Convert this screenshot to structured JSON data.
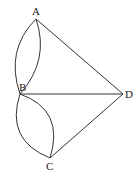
{
  "diagram": {
    "type": "geometry",
    "points": {
      "A": {
        "label": "A",
        "x": 36,
        "y": 19
      },
      "B": {
        "label": "B",
        "x": 20,
        "y": 94
      },
      "C": {
        "label": "C",
        "x": 50,
        "y": 158
      },
      "D": {
        "label": "D",
        "x": 123,
        "y": 94
      }
    },
    "segments": [
      {
        "from": "A",
        "to": "D"
      },
      {
        "from": "B",
        "to": "D"
      },
      {
        "from": "C",
        "to": "D"
      }
    ],
    "arcs": [
      {
        "from": "A",
        "to": "B",
        "side": "outer"
      },
      {
        "from": "A",
        "to": "B",
        "side": "inner"
      },
      {
        "from": "B",
        "to": "C",
        "side": "outer"
      },
      {
        "from": "B",
        "to": "C",
        "side": "inner"
      }
    ],
    "colors": {
      "stroke": "#333333",
      "text": "#222222",
      "background": "#ffffff"
    }
  }
}
